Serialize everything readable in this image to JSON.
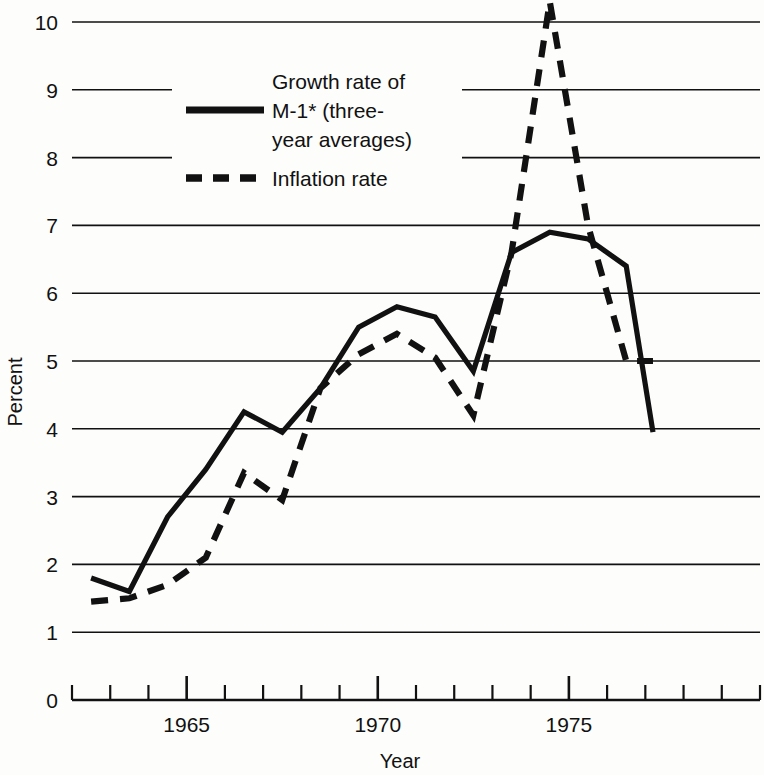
{
  "chart_data": {
    "type": "line",
    "title": "",
    "xlabel": "Year",
    "ylabel": "Percent",
    "xlim": [
      1962,
      1980
    ],
    "ylim": [
      0,
      10.6
    ],
    "grid": true,
    "legend_position": "upper-left-inside",
    "y_ticks": [
      0,
      1,
      2,
      3,
      4,
      5,
      6,
      7,
      8,
      9,
      10
    ],
    "y_tick_labels": [
      "0",
      "1",
      "2",
      "3",
      "4",
      "5",
      "6",
      "7",
      "8",
      "9",
      "10"
    ],
    "x_ticks": [
      1962,
      1963,
      1964,
      1965,
      1966,
      1967,
      1968,
      1969,
      1970,
      1971,
      1972,
      1973,
      1974,
      1975,
      1976,
      1977,
      1978,
      1979,
      1980
    ],
    "x_major_ticks": [
      1965,
      1970,
      1975
    ],
    "x_tick_labels": [
      "1965",
      "1970",
      "1975"
    ],
    "series": [
      {
        "name": "Growth rate of M-1* (three-year averages)",
        "style": "solid",
        "x": [
          1962.5,
          1963.5,
          1964.5,
          1965.5,
          1966.5,
          1967.5,
          1968.5,
          1969.5,
          1970.5,
          1971.5,
          1972.5,
          1973.5,
          1974.5,
          1975.5,
          1976.5,
          1977.2
        ],
        "values": [
          1.8,
          1.6,
          2.7,
          3.4,
          4.25,
          3.95,
          4.6,
          5.5,
          5.8,
          5.65,
          4.85,
          6.6,
          6.9,
          6.8,
          6.4,
          3.95
        ]
      },
      {
        "name": "Inflation rate",
        "style": "dashed",
        "x": [
          1962.5,
          1963.5,
          1964.5,
          1965.5,
          1966.5,
          1967.5,
          1968.5,
          1969.5,
          1970.5,
          1971.5,
          1972.5,
          1973.5,
          1974.5,
          1975.5,
          1976.5,
          1977.2
        ],
        "values": [
          1.45,
          1.5,
          1.7,
          2.1,
          3.35,
          2.95,
          4.6,
          5.1,
          5.4,
          5.05,
          4.2,
          6.6,
          10.3,
          7.0,
          5.0,
          5.0
        ]
      }
    ]
  },
  "legend": {
    "entries": [
      {
        "label_line1": "Growth rate of",
        "label_line2": "M-1* (three-",
        "label_line3": "year averages)",
        "style": "solid"
      },
      {
        "label_line1": "Inflation rate",
        "style": "dashed"
      }
    ]
  },
  "axes": {
    "y_title": "Percent",
    "x_title": "Year"
  }
}
